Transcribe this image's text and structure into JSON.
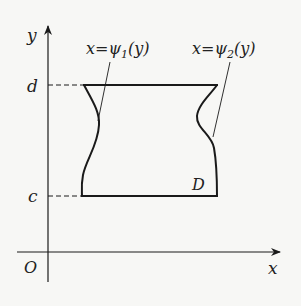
{
  "diagram": {
    "axes": {
      "x_label": "x",
      "y_label": "y",
      "origin_label": "O"
    },
    "bounds": {
      "lower": "c",
      "upper": "d"
    },
    "curves": [
      {
        "name": "left",
        "label_prefix": "x=ψ",
        "subscript": "1",
        "label_suffix": "(y)"
      },
      {
        "name": "right",
        "label_prefix": "x=ψ",
        "subscript": "2",
        "label_suffix": "(y)"
      }
    ],
    "region_label": "D",
    "colors": {
      "ink": "#1a1a1a",
      "background": "#f7f7f5"
    }
  }
}
